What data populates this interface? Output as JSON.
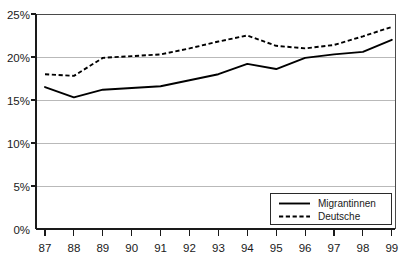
{
  "chart_data": {
    "type": "line",
    "title": "",
    "xlabel": "",
    "ylabel": "",
    "x": [
      "87",
      "88",
      "89",
      "90",
      "91",
      "92",
      "93",
      "94",
      "95",
      "96",
      "97",
      "98",
      "99"
    ],
    "categories": [
      "87",
      "88",
      "89",
      "90",
      "91",
      "92",
      "93",
      "94",
      "95",
      "96",
      "97",
      "98",
      "99"
    ],
    "series": [
      {
        "name": "Migrantinnen",
        "style": "solid",
        "color": "#000000",
        "values": [
          16.5,
          15.3,
          16.2,
          16.4,
          16.6,
          17.3,
          18.0,
          19.2,
          18.6,
          19.9,
          20.3,
          20.6,
          22.0
        ]
      },
      {
        "name": "Deutsche",
        "style": "dashed",
        "color": "#000000",
        "values": [
          18.0,
          17.8,
          19.9,
          20.1,
          20.3,
          21.0,
          21.8,
          22.5,
          21.3,
          21.0,
          21.4,
          22.4,
          23.5
        ]
      }
    ],
    "ylim": [
      0,
      25
    ],
    "xlim": [
      "87",
      "99"
    ],
    "ytick_labels": [
      "25%",
      "20%",
      "15%",
      "10%",
      "5%",
      "0%"
    ],
    "ytick_values": [
      25,
      20,
      15,
      10,
      5,
      0
    ],
    "grid": true,
    "grid_axis": "y",
    "legend_position": "bottom-right",
    "legend_entries": [
      {
        "label": "Migrantinnen",
        "style": "solid"
      },
      {
        "label": "Deutsche",
        "style": "dashed"
      }
    ]
  },
  "axes": {
    "y_labels": [
      "25%",
      "20%",
      "15%",
      "10%",
      "5%",
      "0%"
    ],
    "x_labels": [
      "87",
      "88",
      "89",
      "90",
      "91",
      "92",
      "93",
      "94",
      "95",
      "96",
      "97",
      "98",
      "99"
    ]
  },
  "legend": {
    "items": [
      {
        "label": "Migrantinnen"
      },
      {
        "label": "Deutsche"
      }
    ]
  },
  "colors": {
    "line": "#000000",
    "grid": "#b9b9b9",
    "axis": "#1a1a1a",
    "background": "#ffffff"
  },
  "ghost_title": ""
}
